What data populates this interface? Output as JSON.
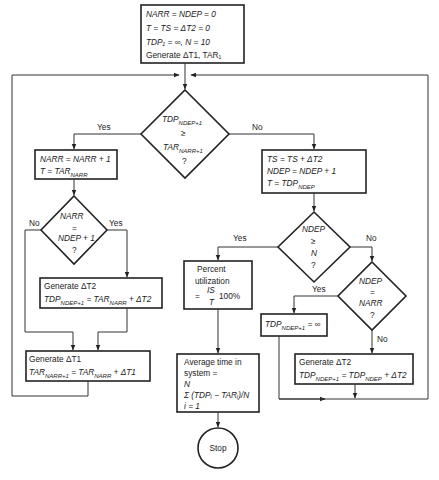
{
  "diagram": {
    "type": "flowchart",
    "start_box": {
      "lines": [
        "NARR = NDEP = 0",
        "T = TS = ΔT2 = 0",
        "TDP₁ = ∞, N = 10",
        "Generate ΔT1, TAR₁"
      ]
    },
    "decision_main": {
      "line1": "TDP",
      "line1_sub": "NDEP+1",
      "line2": "≥",
      "line3": "TAR",
      "line3_sub": "NARR+1",
      "line4": "?",
      "yes_label": "Yes",
      "no_label": "No"
    },
    "arrival_box": {
      "line1": "NARR = NARR + 1",
      "line2": "T = TAR",
      "line2_sub": "NARR"
    },
    "decision_narr": {
      "line1": "NARR",
      "line2": "=",
      "line3": "NDEP + 1",
      "line4": "?",
      "no_label": "No",
      "yes_label": "Yes"
    },
    "gen_dt2_left_box": {
      "line1": "Generate ΔT2",
      "line2_a": "TDP",
      "line2_a_sub": "NDEP+1",
      "line2_b": " = TAR",
      "line2_b_sub": "NARR",
      "line2_c": " + ΔT2"
    },
    "gen_dt1_box": {
      "line1": "Generate ΔT1",
      "line2_a": "TAR",
      "line2_a_sub": "NARR+1",
      "line2_b": " = TAR",
      "line2_b_sub": "NARR",
      "line2_c": " + ΔT1"
    },
    "departure_box": {
      "line1": "TS = TS + ΔT2",
      "line2": "NDEP = NDEP + 1",
      "line3": "T = TDP",
      "line3_sub": "NDEP"
    },
    "decision_ndep_n": {
      "line1": "NDEP",
      "line2": "≥",
      "line3": "N",
      "line4": "?",
      "yes_label": "Yes",
      "no_label": "No"
    },
    "utilization_box": {
      "line1": "Percent",
      "line2": "utilization",
      "line3_prefix": "=",
      "frac_num": "IS",
      "frac_den": "T",
      "line3_suffix": "100%"
    },
    "decision_ndep_narr": {
      "line1": "NDEP",
      "line2": "=",
      "line3": "NARR",
      "line4": "?",
      "yes_label": "Yes",
      "no_label": "No"
    },
    "tdp_inf_box": {
      "line_a": "TDP",
      "line_a_sub": "NDEP+1",
      "line_b": " = ∞"
    },
    "gen_dt2_right_box": {
      "line1": "Generate ΔT2",
      "line2_a": "TDP",
      "line2_a_sub": "NDEP+1",
      "line2_b": " = TDP",
      "line2_b_sub": "NDEP",
      "line2_c": " + ΔT2"
    },
    "avg_time_box": {
      "line1": "Average time in",
      "line2": "system =",
      "line3": "N",
      "line4": "Σ (TDPᵢ − TARᵢ)/N",
      "line5": "i = 1"
    },
    "stop": {
      "label": "Stop"
    }
  }
}
